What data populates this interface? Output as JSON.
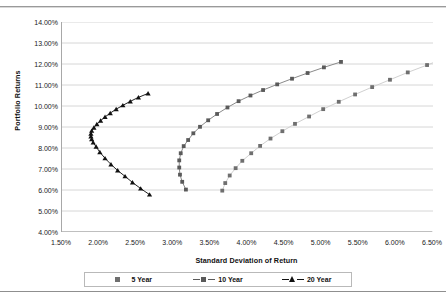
{
  "chart_data": {
    "type": "scatter",
    "title": "",
    "xlabel": "Standard Deviation of Return",
    "ylabel": "Portfolio Returns",
    "xlim": [
      1.5,
      6.5
    ],
    "ylim": [
      4.0,
      14.0
    ],
    "xticks": [
      "1.50%",
      "2.00%",
      "2.50%",
      "3.00%",
      "3.50%",
      "4.00%",
      "4.50%",
      "5.00%",
      "5.50%",
      "6.00%",
      "6.50%"
    ],
    "xtick_values": [
      1.5,
      2.0,
      2.5,
      3.0,
      3.5,
      4.0,
      4.5,
      5.0,
      5.5,
      6.0,
      6.5
    ],
    "yticks": [
      "14.00%",
      "13.00%",
      "12.00%",
      "11.00%",
      "10.00%",
      "9.00%",
      "8.00%",
      "7.00%",
      "6.00%",
      "5.00%",
      "4.00%"
    ],
    "ytick_values": [
      14.0,
      13.0,
      12.0,
      11.0,
      10.0,
      9.0,
      8.0,
      7.0,
      6.0,
      5.0,
      4.0
    ],
    "grid": "horizontal",
    "legend_position": "bottom",
    "series": [
      {
        "name": "5 Year",
        "color": "#6f6f6f",
        "line_color": "#d0d0d0",
        "marker": "square",
        "points": [
          [
            3.66,
            5.97
          ],
          [
            3.7,
            6.33
          ],
          [
            3.76,
            6.69
          ],
          [
            3.84,
            7.04
          ],
          [
            3.93,
            7.39
          ],
          [
            4.05,
            7.75
          ],
          [
            4.17,
            8.1
          ],
          [
            4.31,
            8.45
          ],
          [
            4.47,
            8.8
          ],
          [
            4.64,
            9.15
          ],
          [
            4.83,
            9.5
          ],
          [
            5.02,
            9.85
          ],
          [
            5.23,
            10.2
          ],
          [
            5.45,
            10.55
          ],
          [
            5.68,
            10.9
          ],
          [
            5.92,
            11.25
          ],
          [
            6.16,
            11.6
          ],
          [
            6.42,
            11.95
          ],
          [
            6.68,
            12.3
          ]
        ]
      },
      {
        "name": "10 Year",
        "color": "#5a5a5a",
        "line_color": "#8a8a8a",
        "marker": "square",
        "points": [
          [
            3.17,
            6.02
          ],
          [
            3.12,
            6.39
          ],
          [
            3.09,
            6.73
          ],
          [
            3.08,
            7.07
          ],
          [
            3.08,
            7.41
          ],
          [
            3.1,
            7.75
          ],
          [
            3.14,
            8.09
          ],
          [
            3.2,
            8.38
          ],
          [
            3.27,
            8.7
          ],
          [
            3.36,
            9.01
          ],
          [
            3.47,
            9.32
          ],
          [
            3.59,
            9.62
          ],
          [
            3.73,
            9.93
          ],
          [
            3.88,
            10.23
          ],
          [
            4.04,
            10.5
          ],
          [
            4.21,
            10.76
          ],
          [
            4.4,
            11.03
          ],
          [
            4.6,
            11.3
          ],
          [
            4.81,
            11.57
          ],
          [
            5.03,
            11.84
          ],
          [
            5.26,
            12.1
          ]
        ]
      },
      {
        "name": "20 Year",
        "color": "#111111",
        "line_color": "#222222",
        "marker": "triangle",
        "points": [
          [
            2.68,
            5.78
          ],
          [
            2.56,
            6.07
          ],
          [
            2.45,
            6.36
          ],
          [
            2.35,
            6.65
          ],
          [
            2.25,
            6.93
          ],
          [
            2.16,
            7.22
          ],
          [
            2.08,
            7.51
          ],
          [
            2.01,
            7.8
          ],
          [
            1.96,
            8.06
          ],
          [
            1.92,
            8.26
          ],
          [
            1.9,
            8.42
          ],
          [
            1.89,
            8.55
          ],
          [
            1.89,
            8.68
          ],
          [
            1.9,
            8.82
          ],
          [
            1.93,
            8.97
          ],
          [
            1.97,
            9.13
          ],
          [
            2.02,
            9.3
          ],
          [
            2.08,
            9.48
          ],
          [
            2.15,
            9.66
          ],
          [
            2.23,
            9.85
          ],
          [
            2.32,
            10.03
          ],
          [
            2.42,
            10.22
          ],
          [
            2.53,
            10.41
          ],
          [
            2.66,
            10.6
          ]
        ]
      }
    ]
  },
  "legend": {
    "items": [
      {
        "label": "5 Year"
      },
      {
        "label": "10 Year"
      },
      {
        "label": "20 Year"
      }
    ]
  }
}
